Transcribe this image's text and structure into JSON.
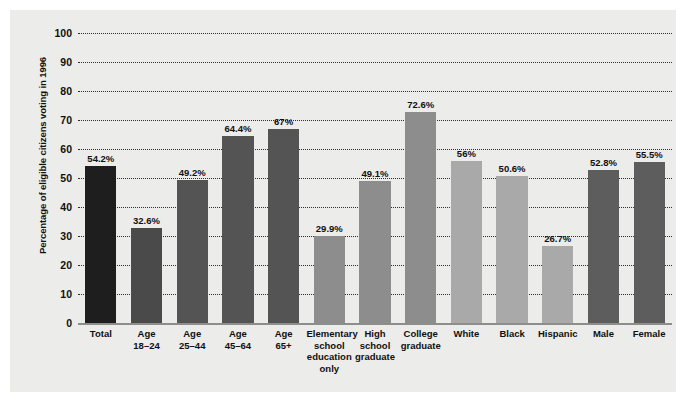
{
  "chart_data": {
    "type": "bar",
    "title": "",
    "subtitle": "",
    "xlabel": "",
    "ylabel": "Percentage of eligible citizens voting in 1996",
    "ylim": [
      0,
      100
    ],
    "yticks": [
      0,
      10,
      20,
      30,
      40,
      50,
      60,
      70,
      80,
      90,
      100
    ],
    "ytick_labels": [
      "0",
      "10",
      "20",
      "30",
      "40",
      "50",
      "60",
      "70",
      "80",
      "90",
      "100"
    ],
    "grid": true,
    "legend": "none",
    "categories": [
      "Total",
      "Age\n18–24",
      "Age\n25–44",
      "Age\n45–64",
      "Age\n65+",
      "Elementary\nschool\neducation\nonly",
      "High\nschool\ngraduate",
      "College\ngraduate",
      "White",
      "Black",
      "Hispanic",
      "Male",
      "Female"
    ],
    "values": [
      54.2,
      32.6,
      49.2,
      64.4,
      67.0,
      29.9,
      49.1,
      72.6,
      56.0,
      50.6,
      26.7,
      52.8,
      55.5
    ],
    "value_labels": [
      "54.2%",
      "32.6%",
      "49.2%",
      "64.4%",
      "67%",
      "29.9%",
      "49.1%",
      "72.6%",
      "56%",
      "50.6%",
      "26.7%",
      "52.8%",
      "55.5%"
    ],
    "bar_colors": [
      "#1e1e1e",
      "#4a4a4a",
      "#545454",
      "#545454",
      "#545454",
      "#8d8d8d",
      "#8d8d8d",
      "#8d8d8d",
      "#a9a9a9",
      "#a9a9a9",
      "#a9a9a9",
      "#5d5d5d",
      "#5d5d5d"
    ],
    "colors": {
      "background": "#ececeb",
      "page": "#ffffff",
      "gridline": "#2c2c2c",
      "axis": "#8d8d8d",
      "text": "#101010"
    }
  }
}
